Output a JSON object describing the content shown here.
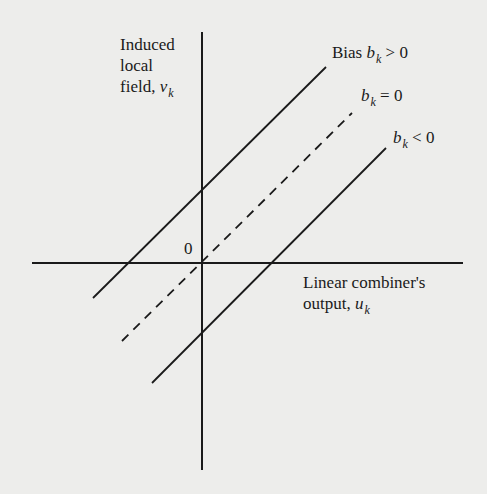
{
  "diagram": {
    "y_axis": {
      "line1": "Induced",
      "line2": "local",
      "line3_prefix": "field, ",
      "symbol": "v",
      "subscript": "k"
    },
    "x_axis": {
      "line1": "Linear combiner's",
      "line2_prefix": "output, ",
      "symbol": "u",
      "subscript": "k"
    },
    "origin_label": "0",
    "lines": [
      {
        "name": "bias-positive",
        "prefix": "Bias ",
        "symbol": "b",
        "subscript": "k",
        "relation": " > 0",
        "style": "solid"
      },
      {
        "name": "bias-zero",
        "prefix": "",
        "symbol": "b",
        "subscript": "k",
        "relation": " = 0",
        "style": "dashed"
      },
      {
        "name": "bias-negative",
        "prefix": "",
        "symbol": "b",
        "subscript": "k",
        "relation": " < 0",
        "style": "solid"
      }
    ],
    "colors": {
      "background": "#ededeb",
      "ink": "#1a1a1a"
    }
  }
}
